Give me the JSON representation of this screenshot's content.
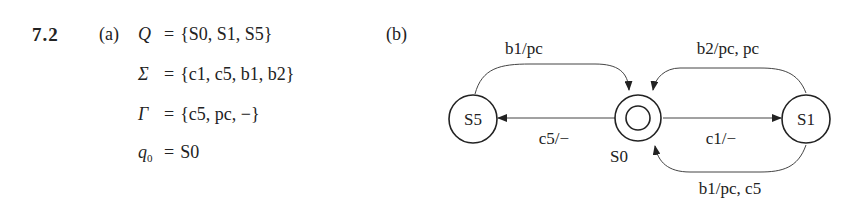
{
  "problem": {
    "number": "7.2",
    "part_a": {
      "label": "(a)",
      "definitions": [
        {
          "symbol": "Q",
          "subscript": "",
          "value": "{S0, S1, S5}"
        },
        {
          "symbol": "Σ",
          "subscript": "",
          "value": "{c1, c5, b1, b2}"
        },
        {
          "symbol": "Γ",
          "subscript": "",
          "value": "{c5, pc, −}"
        },
        {
          "symbol": "q",
          "subscript": "0",
          "value": "S0"
        }
      ]
    },
    "part_b": {
      "label": "(b)",
      "states": [
        {
          "id": "S5",
          "label": "S5",
          "accepting": false
        },
        {
          "id": "S0",
          "label": "S0",
          "accepting": true,
          "initial": true
        },
        {
          "id": "S1",
          "label": "S1",
          "accepting": false
        }
      ],
      "transitions": [
        {
          "from": "S5",
          "to": "S0",
          "label": "b1/pc"
        },
        {
          "from": "S1",
          "to": "S0",
          "label": "b2/pc, pc"
        },
        {
          "from": "S0",
          "to": "S5",
          "label": "c5/−"
        },
        {
          "from": "S0",
          "to": "S1",
          "label": "c1/−"
        },
        {
          "from": "S1",
          "to": "S0",
          "label": "b1/pc, c5"
        }
      ]
    }
  }
}
